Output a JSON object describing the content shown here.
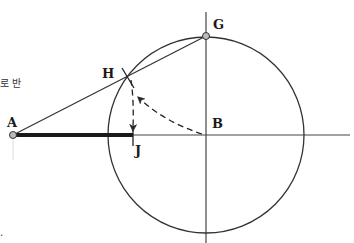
{
  "diagram": {
    "labels": {
      "A": "A",
      "B": "B",
      "G": "G",
      "H": "H",
      "J": "J"
    },
    "side_text": {
      "top": "로 반",
      "bottom": "."
    },
    "colors": {
      "line": "#2a2a2a",
      "thick_segment": "#1a1a1a",
      "point_fill": "#bbbbbb",
      "background": "#ffffff"
    },
    "points": {
      "A": [
        13,
        135
      ],
      "B": [
        206,
        135
      ],
      "G": [
        206,
        36
      ],
      "H": [
        131,
        77
      ],
      "J": [
        133,
        135
      ]
    },
    "circle": {
      "center": "B",
      "radius": 98
    }
  }
}
